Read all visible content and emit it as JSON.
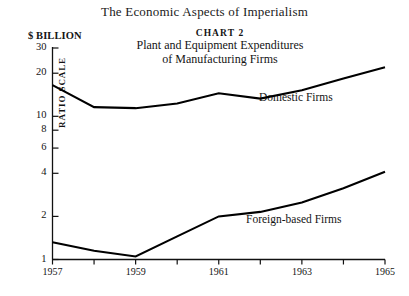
{
  "page": {
    "book_title": "The Economic Aspects of Imperialism"
  },
  "header": {
    "chart_number": "CHART 2",
    "title_line1": "Plant and Equipment Expenditures",
    "title_line2": "of Manufacturing Firms",
    "unit_label": "$ BILLION"
  },
  "chart_data": {
    "type": "line",
    "title": "Plant and Equipment Expenditures of Manufacturing Firms",
    "subtitle": "CHART 2",
    "xlabel": "",
    "ylabel": "$ BILLION",
    "scale_note": "RATIO SCALE",
    "yscale": "log",
    "ylim": [
      1,
      30
    ],
    "xlim": [
      1957,
      1965
    ],
    "grid": false,
    "legend_position": "inline-labels",
    "ytick_values": [
      1,
      2,
      4,
      6,
      8,
      10,
      20,
      30
    ],
    "ytick_labels": [
      "1",
      "2",
      "4",
      "6",
      "8",
      "10",
      "20",
      "30"
    ],
    "xtick_values": [
      1957,
      1958,
      1959,
      1960,
      1961,
      1962,
      1963,
      1964,
      1965
    ],
    "xtick_labels": [
      "1957",
      "",
      "1959",
      "",
      "1961",
      "",
      "1963",
      "",
      "1965"
    ],
    "x": [
      1957,
      1958,
      1959,
      1960,
      1961,
      1962,
      1963,
      1964,
      1965
    ],
    "series": [
      {
        "name": "Domestic Firms",
        "values": [
          16.5,
          11.6,
          11.4,
          12.3,
          14.5,
          13.3,
          15.2,
          18.4,
          22.0
        ]
      },
      {
        "name": "Foreign-based Firms",
        "values": [
          1.32,
          1.15,
          1.05,
          1.45,
          2.0,
          2.15,
          2.5,
          3.15,
          4.1
        ]
      }
    ],
    "annotations": [
      {
        "text": "Domestic Firms",
        "x": 1963.0,
        "y": 12.6
      },
      {
        "text": "Foreign-based Firms",
        "x": 1962.6,
        "y": 1.95
      }
    ]
  },
  "axes": {
    "y_ticks": [
      {
        "label": "30",
        "value": 30
      },
      {
        "label": "20",
        "value": 20
      },
      {
        "label": "10",
        "value": 10
      },
      {
        "label": "8",
        "value": 8
      },
      {
        "label": "6",
        "value": 6
      },
      {
        "label": "4",
        "value": 4
      },
      {
        "label": "2",
        "value": 2
      },
      {
        "label": "1",
        "value": 1
      }
    ],
    "x_ticks": [
      {
        "label": "1957",
        "value": 1957
      },
      {
        "label": "1959",
        "value": 1959
      },
      {
        "label": "1961",
        "value": 1961
      },
      {
        "label": "1963",
        "value": 1963
      },
      {
        "label": "1965",
        "value": 1965
      }
    ],
    "ratio_scale_label": "RATIO SCALE"
  },
  "colors": {
    "ink": "#141414",
    "line": "#000000",
    "background": "#ffffff"
  }
}
